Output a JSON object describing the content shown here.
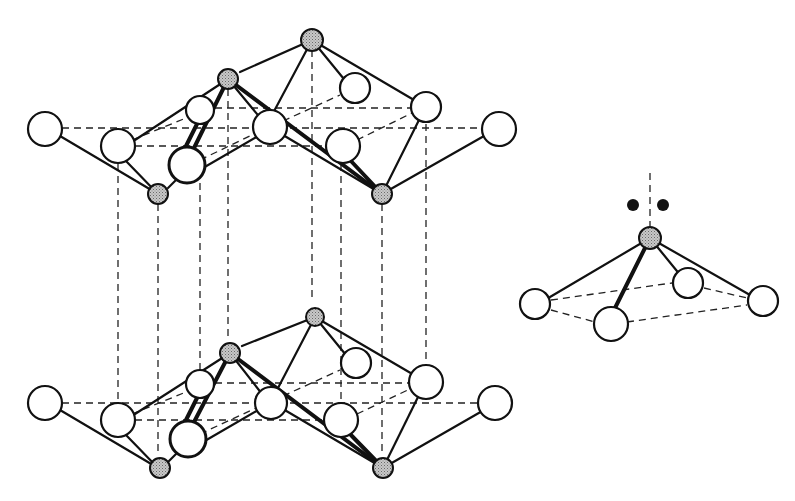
{
  "figure": {
    "colors": {
      "background": "#ffffff",
      "line": "#111111",
      "cation_fill": "#bdbdbd",
      "anion_fill": "#ffffff",
      "lone_pair": "#111111"
    },
    "legend_glyphs": {
      "cation": "small-stippled-circle",
      "anion": "large-open-circle",
      "lone_pair": "pair-of-black-dots"
    },
    "layers": [
      {
        "id": "upper-layer",
        "y_offset": 0
      },
      {
        "id": "lower-layer",
        "y_offset": 258
      }
    ],
    "inset": {
      "label": "coordination-pyramid-with-lone-pair",
      "cation": [
        650,
        238
      ],
      "anions": [
        [
          535,
          304
        ],
        [
          611,
          324
        ],
        [
          688,
          283
        ],
        [
          763,
          301
        ]
      ],
      "lone_pair_dots": [
        [
          633,
          205
        ],
        [
          663,
          205
        ]
      ]
    }
  }
}
